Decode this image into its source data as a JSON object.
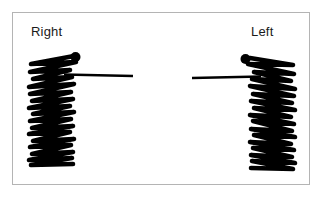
{
  "figure": {
    "background_color": "#ffffff",
    "ink_color": "#000000",
    "frame": {
      "border_color": "#b4b4b4",
      "x": 12,
      "y": 12,
      "width": 298,
      "height": 173
    },
    "panels": [
      {
        "id": "right-panel",
        "label": "Right",
        "label_x": 31,
        "label_y": 24,
        "orientation": "left-side-trace",
        "marker_dot": {
          "cx": 75.5,
          "cy": 57,
          "r": 5
        },
        "baseline": {
          "x1": 64,
          "y1": 74.5,
          "x2": 133,
          "y2": 76,
          "stroke_start": 3.4,
          "stroke_end": 1.2
        },
        "trace": {
          "x_min": 28,
          "x_max": 78,
          "y_top": 55,
          "y_bottom": 167,
          "stroke_width": 4.6,
          "cycles": 17,
          "spine_x": 52,
          "spine_y1": 100,
          "spine_y2": 163,
          "points": [
            [
              74,
              56
            ],
            [
              31,
              64
            ],
            [
              76,
              62
            ],
            [
              30,
              72
            ],
            [
              70,
              70
            ],
            [
              33,
              79
            ],
            [
              72,
              77
            ],
            [
              29,
              87
            ],
            [
              74,
              84
            ],
            [
              30,
              94
            ],
            [
              71,
              92
            ],
            [
              32,
              101
            ],
            [
              73,
              99
            ],
            [
              29,
              108
            ],
            [
              70,
              106
            ],
            [
              33,
              114
            ],
            [
              74,
              112
            ],
            [
              30,
              121
            ],
            [
              71,
              119
            ],
            [
              32,
              128
            ],
            [
              73,
              126
            ],
            [
              29,
              134
            ],
            [
              70,
              132
            ],
            [
              33,
              141
            ],
            [
              74,
              139
            ],
            [
              30,
              147
            ],
            [
              71,
              145
            ],
            [
              32,
              154
            ],
            [
              73,
              152
            ],
            [
              29,
              160
            ],
            [
              72,
              158
            ],
            [
              31,
              165
            ],
            [
              73,
              164
            ]
          ]
        }
      },
      {
        "id": "left-panel",
        "label": "Left",
        "label_x": 251,
        "label_y": 24,
        "orientation": "right-side-trace",
        "marker_dot": {
          "cx": 245.5,
          "cy": 59,
          "r": 5
        },
        "baseline": {
          "x1": 192,
          "y1": 78,
          "x2": 261,
          "y2": 76.5,
          "stroke_start": 1.2,
          "stroke_end": 3.4
        },
        "trace": {
          "x_min": 247,
          "x_max": 296,
          "y_top": 57,
          "y_bottom": 171,
          "stroke_width": 4.6,
          "cycles": 17,
          "spine_x": 272,
          "spine_y1": 103,
          "spine_y2": 167,
          "points": [
            [
              250,
              58
            ],
            [
              293,
              65
            ],
            [
              248,
              64
            ],
            [
              294,
              74
            ],
            [
              254,
              72
            ],
            [
              291,
              81
            ],
            [
              252,
              79
            ],
            [
              295,
              89
            ],
            [
              250,
              86
            ],
            [
              294,
              96
            ],
            [
              253,
              94
            ],
            [
              292,
              103
            ],
            [
              251,
              101
            ],
            [
              295,
              110
            ],
            [
              254,
              108
            ],
            [
              291,
              117
            ],
            [
              250,
              115
            ],
            [
              294,
              124
            ],
            [
              253,
              121
            ],
            [
              292,
              131
            ],
            [
              251,
              129
            ],
            [
              295,
              137
            ],
            [
              254,
              135
            ],
            [
              291,
              144
            ],
            [
              250,
              142
            ],
            [
              294,
              150
            ],
            [
              253,
              148
            ],
            [
              292,
              157
            ],
            [
              251,
              155
            ],
            [
              295,
              163
            ],
            [
              252,
              161
            ],
            [
              293,
              169
            ],
            [
              251,
              168
            ]
          ]
        }
      }
    ]
  }
}
